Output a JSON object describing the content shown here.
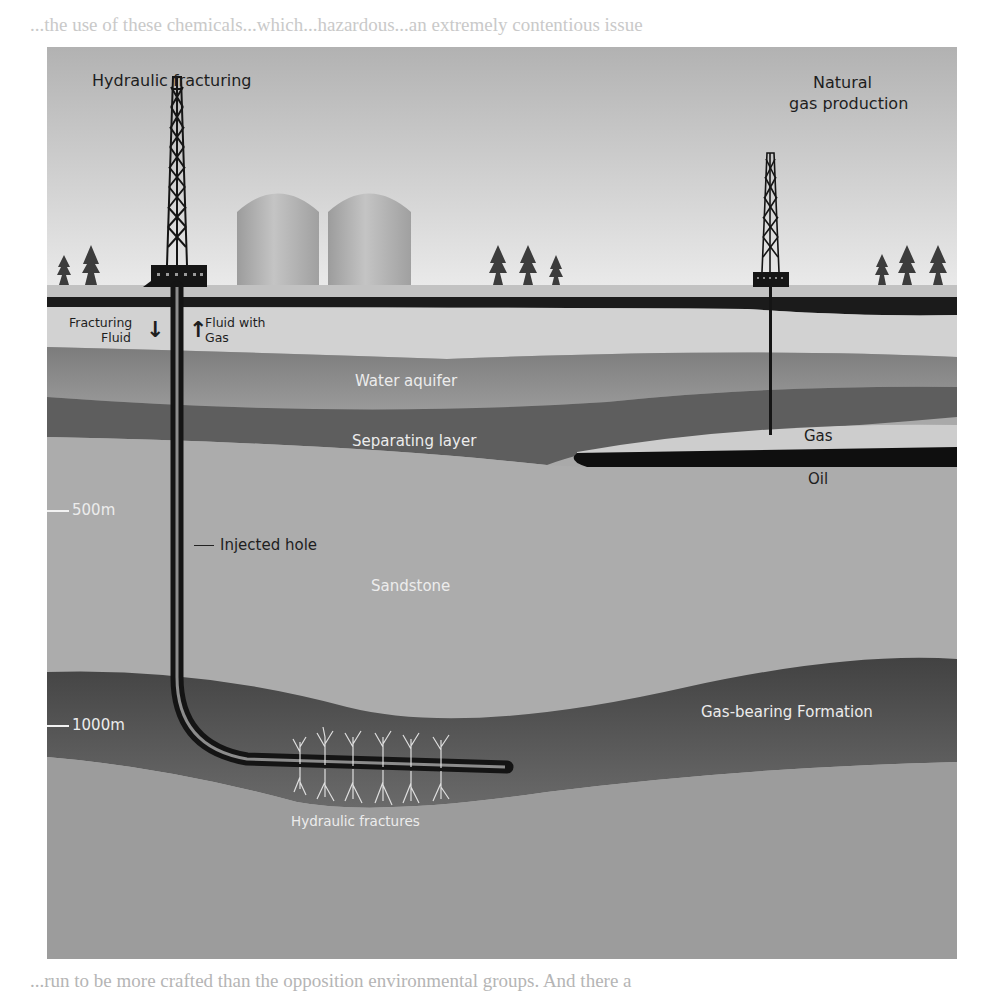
{
  "page": {
    "top_text": "...the use of these chemicals...which...hazardous...an extremely contentious issue",
    "bottom_text": "...run to be more crafted than the opposition environmental groups. And there a",
    "caption_fragment": "Figure 6.11 Hydraulic fracturing"
  },
  "diagram": {
    "title_left": "Hydraulic fracturing",
    "title_right_line1": "Natural",
    "title_right_line2": "gas production",
    "labels": {
      "fracturing_fluid_line1": "Fracturing",
      "fracturing_fluid_line2": "Fluid",
      "fluid_with_gas_line1": "Fluid with",
      "fluid_with_gas_line2": "Gas",
      "water_aquifer": "Water aquifer",
      "separating_layer": "Separating layer",
      "gas": "Gas",
      "oil": "Oil",
      "injected_hole": "Injected hole",
      "sandstone": "Sandstone",
      "gas_bearing_formation": "Gas-bearing Formation",
      "hydraulic_fractures": "Hydraulic fractures"
    },
    "depth_markers": [
      {
        "label": "500m"
      },
      {
        "label": "1000m"
      }
    ],
    "icons": {
      "arrow_down": "↓",
      "arrow_up": "↑"
    },
    "colors": {
      "sky_top": "#b4b4b4",
      "sky_bottom": "#e6e6e6",
      "ground_dark": "#1a1a1a",
      "aquifer": "#8a8a8a",
      "separating": "#6a6a6a",
      "sandstone": "#ababab",
      "gas_formation": "#555555"
    }
  }
}
